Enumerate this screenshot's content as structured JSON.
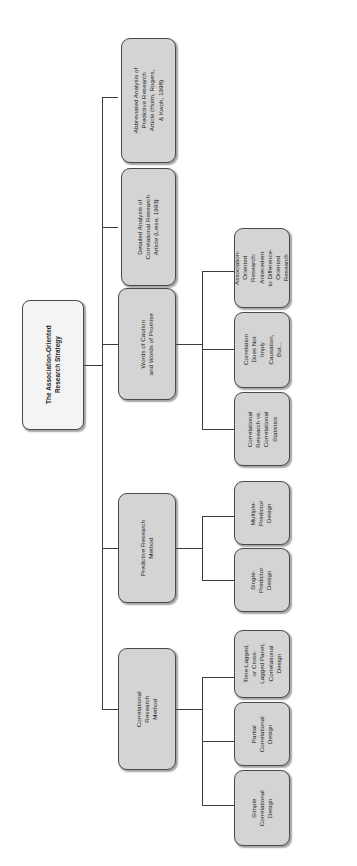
{
  "diagram": {
    "orientation": "rotated-90-counterclockwise-horizontal-tree",
    "root": {
      "id": "root",
      "label": "The Association-Oriented\nResearch Strategy"
    },
    "branches": [
      {
        "id": "correlational-research-method",
        "label": "Correlational\nResearch\nMethod",
        "children": [
          {
            "id": "simple-correlational-design",
            "label": "Simple\nCorrelational\nDesign"
          },
          {
            "id": "partial-correlational-design",
            "label": "Partial\nCorrelational\nDesign"
          },
          {
            "id": "time-lagged-cross-lagged-panel-correlational-design",
            "label": "Time-Lagged,\nor Cross-\nLagged Panel,\nCorrelational\nDesign"
          }
        ]
      },
      {
        "id": "predictive-research-method",
        "label": "Predictive Research\nMethod",
        "children": [
          {
            "id": "single-predictor-design",
            "label": "Single-\nPredictor\nDesign"
          },
          {
            "id": "multiple-predictor-design",
            "label": "Multiple-\nPredictor\nDesign"
          }
        ]
      },
      {
        "id": "words-of-caution-and-words-of-promise",
        "label": "Words of Caution\nand Words of Promise",
        "children": [
          {
            "id": "correlational-research-vs-correlational-statistics",
            "label": "Correlational\nResearch vs.\nCorrelational\nStatistics"
          },
          {
            "id": "correlation-does-not-imply-causation-but",
            "label": "Correlation\nDoes Not\nImply\nCausation,\nBut..."
          },
          {
            "id": "association-oriented-research-antecedent-to-difference-oriented-research",
            "label": "Association-\nOriented\nResearch:\nAntecedent\nto Difference-\nOriented\nResearch"
          }
        ]
      },
      {
        "id": "detailed-analysis-of-correlational-research-article",
        "label": "Detailed Analysis of\nCorrelational Research\nArticle (Leise, 1993)",
        "children": []
      },
      {
        "id": "abbreviated-analysis-of-predictive-research-article",
        "label": "Abbreviated Analysis of\nPredictive Research\nArticle (Holm, Rogers,\n& Kwoh, 1998)",
        "children": []
      }
    ],
    "colors": {
      "node_fill": "#d4d4d4",
      "root_fill": "#f4f4f4",
      "node_border": "#4a4a4a",
      "line": "#3c3c3c",
      "text": "#1b1b1b",
      "background": "#ffffff"
    }
  }
}
